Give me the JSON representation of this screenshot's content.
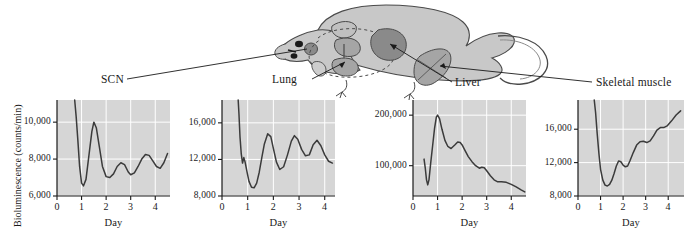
{
  "figure": {
    "ylabel": "Bioluminescence (counts/min)",
    "xlabel": "Day",
    "illustration_name": "mouse-diagram",
    "organ_labels": [
      "SCN",
      "Lung",
      "Liver",
      "Skeletal muscle"
    ],
    "colors": {
      "plot_background": "#d6d6d6",
      "gridline": "#ffffff",
      "curve": "#3b3b3b",
      "axis": "#1a1a1a",
      "mouse_body": "#c8c8c8",
      "organ_dark": "#8a8a8a",
      "organ_mid": "#a5a5a5"
    }
  },
  "chart_data": [
    {
      "type": "line",
      "title": "SCN",
      "xlabel": "Day",
      "ylabel": "Bioluminescence (counts/min)",
      "xlim": [
        0,
        4.6
      ],
      "ylim": [
        6000,
        11200
      ],
      "xticks": [
        0,
        1,
        2,
        3,
        4
      ],
      "yticks": [
        6000,
        8000,
        10000
      ],
      "ytick_labels": [
        "6,000",
        "8,000",
        "10,000"
      ],
      "grid": true,
      "legend": "none",
      "x": [
        0.72,
        0.78,
        0.85,
        0.92,
        1.0,
        1.08,
        1.18,
        1.3,
        1.42,
        1.5,
        1.6,
        1.72,
        1.85,
        2.0,
        2.15,
        2.3,
        2.45,
        2.6,
        2.75,
        2.9,
        3.0,
        3.15,
        3.3,
        3.45,
        3.6,
        3.75,
        3.9,
        4.05,
        4.2,
        4.35,
        4.5
      ],
      "y": [
        11200,
        10300,
        9000,
        7600,
        6700,
        6550,
        6900,
        8200,
        9500,
        10000,
        9700,
        8700,
        7600,
        7050,
        7000,
        7200,
        7600,
        7800,
        7700,
        7300,
        7150,
        7250,
        7600,
        8000,
        8250,
        8200,
        7900,
        7600,
        7500,
        7800,
        8300
      ]
    },
    {
      "type": "line",
      "title": "Lung",
      "xlabel": "Day",
      "ylabel": "Bioluminescence (counts/min)",
      "xlim": [
        0,
        4.4
      ],
      "ylim": [
        8000,
        18500
      ],
      "xticks": [
        0,
        1,
        2,
        3,
        4
      ],
      "yticks": [
        8000,
        12000,
        16000
      ],
      "ytick_labels": [
        "8,000",
        "12,000",
        "16,000"
      ],
      "grid": true,
      "legend": "none",
      "x": [
        0.63,
        0.66,
        0.7,
        0.75,
        0.8,
        0.85,
        0.9,
        0.97,
        1.05,
        1.15,
        1.25,
        1.35,
        1.45,
        1.55,
        1.65,
        1.78,
        1.9,
        2.0,
        2.12,
        2.25,
        2.4,
        2.55,
        2.7,
        2.82,
        2.95,
        3.1,
        3.25,
        3.4,
        3.55,
        3.7,
        3.85,
        4.0,
        4.15,
        4.3
      ],
      "y": [
        18500,
        17000,
        14500,
        12600,
        11600,
        12200,
        11700,
        10700,
        9600,
        8950,
        8900,
        9400,
        10600,
        12200,
        13700,
        14800,
        14500,
        13200,
        11700,
        10900,
        11200,
        12500,
        14000,
        14600,
        14200,
        13100,
        12400,
        12500,
        13600,
        14100,
        13500,
        12500,
        11800,
        11600
      ]
    },
    {
      "type": "line",
      "title": "Liver",
      "xlabel": "Day",
      "ylabel": "Bioluminescence (counts/min)",
      "xlim": [
        0,
        4.6
      ],
      "ylim": [
        40000,
        230000
      ],
      "xticks": [
        0,
        1,
        2,
        3,
        4
      ],
      "yticks": [
        100000,
        200000
      ],
      "ytick_labels": [
        "100,000",
        "200,000"
      ],
      "grid": true,
      "legend": "none",
      "x": [
        0.45,
        0.5,
        0.55,
        0.6,
        0.65,
        0.72,
        0.8,
        0.88,
        0.95,
        1.0,
        1.08,
        1.18,
        1.3,
        1.42,
        1.55,
        1.7,
        1.82,
        1.92,
        2.0,
        2.12,
        2.25,
        2.4,
        2.55,
        2.7,
        2.8,
        2.9,
        3.0,
        3.15,
        3.3,
        3.45,
        3.6,
        3.8,
        4.0,
        4.2,
        4.4,
        4.55
      ],
      "y": [
        113000,
        95000,
        72000,
        62000,
        72000,
        105000,
        140000,
        175000,
        196000,
        200000,
        193000,
        172000,
        150000,
        138000,
        134000,
        141000,
        147000,
        146000,
        141000,
        130000,
        118000,
        108000,
        100000,
        95000,
        97000,
        96000,
        90000,
        80000,
        72000,
        68000,
        68000,
        67000,
        63000,
        58000,
        52000,
        48000
      ]
    },
    {
      "type": "line",
      "title": "Skeletal muscle",
      "xlabel": "Day",
      "ylabel": "Bioluminescence (counts/min)",
      "xlim": [
        0,
        4.7
      ],
      "ylim": [
        8000,
        19500
      ],
      "xticks": [
        0,
        1,
        2,
        3,
        4
      ],
      "yticks": [
        8000,
        12000,
        16000
      ],
      "ytick_labels": [
        "8,000",
        "12,000",
        "16,000"
      ],
      "grid": true,
      "legend": "none",
      "x": [
        0.72,
        0.78,
        0.85,
        0.93,
        1.0,
        1.1,
        1.2,
        1.3,
        1.4,
        1.5,
        1.6,
        1.7,
        1.8,
        1.9,
        2.0,
        2.1,
        2.2,
        2.3,
        2.45,
        2.6,
        2.75,
        2.9,
        3.05,
        3.2,
        3.35,
        3.5,
        3.65,
        3.8,
        3.95,
        4.15,
        4.35,
        4.55
      ],
      "y": [
        19500,
        18000,
        15500,
        13000,
        11200,
        9900,
        9300,
        9200,
        9400,
        9900,
        10700,
        11600,
        12200,
        12100,
        11700,
        11500,
        11600,
        12200,
        13200,
        14100,
        14500,
        14550,
        14400,
        14600,
        15200,
        15900,
        16200,
        16200,
        16400,
        17000,
        17700,
        18200
      ]
    }
  ],
  "charts_meta": [
    {
      "name": "scn-chart",
      "label": "SCN"
    },
    {
      "name": "lung-chart",
      "label": "Lung"
    },
    {
      "name": "liver-chart",
      "label": "Liver"
    },
    {
      "name": "skeletal-muscle-chart",
      "label": "Skeletal muscle"
    }
  ]
}
